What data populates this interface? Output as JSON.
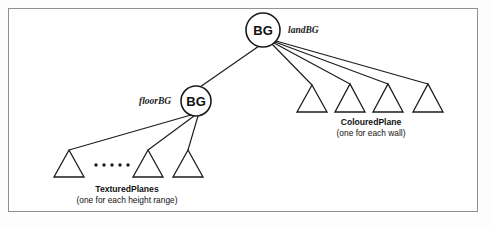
{
  "figure": {
    "kind": "scene-graph-diagram",
    "background_color": "#ffffff",
    "frame_color": "#8e9194",
    "line_color": "#1b1b1b",
    "width": 492,
    "height": 227
  },
  "nodes": {
    "root": {
      "label": "BG",
      "annotation": "landBG",
      "cx": 263,
      "cy": 30,
      "r": 17,
      "annotation_x": 288,
      "annotation_y": 33
    },
    "floor": {
      "label": "BG",
      "annotation": "floorBG",
      "cx": 196,
      "cy": 101,
      "r": 15,
      "annotation_x": 139,
      "annotation_y": 104
    }
  },
  "edges": [
    {
      "name": "root-to-floor",
      "x1": 259,
      "y1": 46,
      "x2": 200,
      "y2": 87
    },
    {
      "name": "root-to-colouredplane-1",
      "x1": 272,
      "y1": 44,
      "x2": 312,
      "y2": 85
    },
    {
      "name": "root-to-colouredplane-2",
      "x1": 274,
      "y1": 43,
      "x2": 350,
      "y2": 84
    },
    {
      "name": "root-to-colouredplane-3",
      "x1": 275,
      "y1": 42,
      "x2": 388,
      "y2": 84
    },
    {
      "name": "root-to-colouredplane-4",
      "x1": 276,
      "y1": 41,
      "x2": 428,
      "y2": 84
    },
    {
      "name": "floor-to-texturedplane-1",
      "x1": 191,
      "y1": 115,
      "x2": 69,
      "y2": 150
    },
    {
      "name": "floor-to-texturedplane-2",
      "x1": 194,
      "y1": 116,
      "x2": 148,
      "y2": 150
    },
    {
      "name": "floor-to-texturedplane-3",
      "x1": 198,
      "y1": 116,
      "x2": 188,
      "y2": 150
    }
  ],
  "leaf_groups": [
    {
      "name": "colouredplane-group",
      "title": "ColouredPlane",
      "subtitle": "(one for each wall)",
      "title_x": 371,
      "title_y": 125,
      "subtitle_x": 371,
      "subtitle_y": 136,
      "triangles": [
        {
          "apex_x": 312,
          "apex_y": 85,
          "left_x": 297,
          "right_x": 327,
          "base_y": 112
        },
        {
          "apex_x": 350,
          "apex_y": 84,
          "left_x": 335,
          "right_x": 365,
          "base_y": 112
        },
        {
          "apex_x": 388,
          "apex_y": 84,
          "left_x": 373,
          "right_x": 403,
          "base_y": 112
        },
        {
          "apex_x": 428,
          "apex_y": 84,
          "left_x": 413,
          "right_x": 443,
          "base_y": 112
        }
      ],
      "ellipsis": []
    },
    {
      "name": "texturedplanes-group",
      "title": "TexturedPlanes",
      "subtitle": "(one for each height range)",
      "title_x": 127,
      "title_y": 192,
      "subtitle_x": 127,
      "subtitle_y": 203,
      "triangles": [
        {
          "apex_x": 69,
          "apex_y": 150,
          "left_x": 54,
          "right_x": 84,
          "base_y": 177
        },
        {
          "apex_x": 148,
          "apex_y": 150,
          "left_x": 133,
          "right_x": 163,
          "base_y": 177
        },
        {
          "apex_x": 188,
          "apex_y": 150,
          "left_x": 173,
          "right_x": 203,
          "base_y": 177
        }
      ],
      "ellipsis": [
        {
          "cx": 96,
          "cy": 165,
          "r": 1.7
        },
        {
          "cx": 104,
          "cy": 165,
          "r": 1.7
        },
        {
          "cx": 112,
          "cy": 165,
          "r": 1.7
        },
        {
          "cx": 120,
          "cy": 165,
          "r": 1.7
        },
        {
          "cx": 128,
          "cy": 165,
          "r": 1.7
        }
      ]
    }
  ]
}
